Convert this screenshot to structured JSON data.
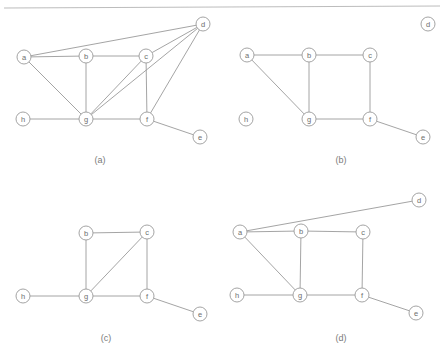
{
  "figure": {
    "width": 444,
    "height": 363,
    "background_color": "#ffffff",
    "line_color": "#9a9a9a",
    "node_fill_color": "#ffffff",
    "label_color": "#6e6e6e",
    "caption_color": "#7a7a7a",
    "node_radius": 7,
    "top_rule": {
      "x1": 4,
      "y1": 8,
      "x2": 440,
      "y2": 6,
      "color": "#b4b4b4"
    }
  },
  "panels": [
    {
      "id": "panel-a",
      "caption": "(a)",
      "caption_pos": {
        "x": 100,
        "y": 160
      },
      "nodes": [
        {
          "id": "a",
          "label": "a",
          "x": 24,
          "y": 57
        },
        {
          "id": "b",
          "label": "b",
          "x": 86,
          "y": 56
        },
        {
          "id": "c",
          "label": "c",
          "x": 146,
          "y": 56
        },
        {
          "id": "d",
          "label": "d",
          "x": 203,
          "y": 24
        },
        {
          "id": "h",
          "label": "h",
          "x": 23,
          "y": 119
        },
        {
          "id": "g",
          "label": "g",
          "x": 86,
          "y": 119
        },
        {
          "id": "f",
          "label": "f",
          "x": 147,
          "y": 119
        },
        {
          "id": "e",
          "label": "e",
          "x": 200,
          "y": 137
        }
      ],
      "edges": [
        {
          "from": "a",
          "to": "b"
        },
        {
          "from": "b",
          "to": "c"
        },
        {
          "from": "a",
          "to": "d"
        },
        {
          "from": "c",
          "to": "d"
        },
        {
          "from": "a",
          "to": "g"
        },
        {
          "from": "b",
          "to": "g"
        },
        {
          "from": "c",
          "to": "g"
        },
        {
          "from": "c",
          "to": "f"
        },
        {
          "from": "d",
          "to": "f"
        },
        {
          "from": "d",
          "to": "g"
        },
        {
          "from": "h",
          "to": "g"
        },
        {
          "from": "g",
          "to": "f"
        },
        {
          "from": "f",
          "to": "e"
        }
      ]
    },
    {
      "id": "panel-b",
      "caption": "(b)",
      "caption_pos": {
        "x": 341,
        "y": 160
      },
      "nodes": [
        {
          "id": "a",
          "label": "a",
          "x": 247,
          "y": 55
        },
        {
          "id": "b",
          "label": "b",
          "x": 309,
          "y": 55
        },
        {
          "id": "c",
          "label": "c",
          "x": 370,
          "y": 55
        },
        {
          "id": "d",
          "label": "d",
          "x": 428,
          "y": 24
        },
        {
          "id": "h",
          "label": "h",
          "x": 246,
          "y": 119
        },
        {
          "id": "g",
          "label": "g",
          "x": 309,
          "y": 119
        },
        {
          "id": "f",
          "label": "f",
          "x": 370,
          "y": 119
        },
        {
          "id": "e",
          "label": "e",
          "x": 423,
          "y": 137
        }
      ],
      "edges": [
        {
          "from": "a",
          "to": "b"
        },
        {
          "from": "b",
          "to": "c"
        },
        {
          "from": "a",
          "to": "g"
        },
        {
          "from": "b",
          "to": "g"
        },
        {
          "from": "c",
          "to": "f"
        },
        {
          "from": "g",
          "to": "f"
        },
        {
          "from": "f",
          "to": "e"
        }
      ]
    },
    {
      "id": "panel-c",
      "caption": "(c)",
      "caption_pos": {
        "x": 106,
        "y": 338
      },
      "nodes": [
        {
          "id": "b",
          "label": "b",
          "x": 86,
          "y": 233
        },
        {
          "id": "c",
          "label": "c",
          "x": 147,
          "y": 232
        },
        {
          "id": "h",
          "label": "h",
          "x": 23,
          "y": 296
        },
        {
          "id": "g",
          "label": "g",
          "x": 86,
          "y": 296
        },
        {
          "id": "f",
          "label": "f",
          "x": 147,
          "y": 296
        },
        {
          "id": "e",
          "label": "e",
          "x": 200,
          "y": 314
        }
      ],
      "edges": [
        {
          "from": "b",
          "to": "c"
        },
        {
          "from": "b",
          "to": "g"
        },
        {
          "from": "c",
          "to": "g"
        },
        {
          "from": "c",
          "to": "f"
        },
        {
          "from": "h",
          "to": "g"
        },
        {
          "from": "g",
          "to": "f"
        },
        {
          "from": "f",
          "to": "e"
        }
      ]
    },
    {
      "id": "panel-d",
      "caption": "(d)",
      "caption_pos": {
        "x": 341,
        "y": 338
      },
      "nodes": [
        {
          "id": "a",
          "label": "a",
          "x": 240,
          "y": 232
        },
        {
          "id": "b",
          "label": "b",
          "x": 301,
          "y": 231
        },
        {
          "id": "c",
          "label": "c",
          "x": 363,
          "y": 232
        },
        {
          "id": "d",
          "label": "d",
          "x": 419,
          "y": 200
        },
        {
          "id": "h",
          "label": "h",
          "x": 237,
          "y": 295
        },
        {
          "id": "g",
          "label": "g",
          "x": 300,
          "y": 295
        },
        {
          "id": "f",
          "label": "f",
          "x": 362,
          "y": 295
        },
        {
          "id": "e",
          "label": "e",
          "x": 416,
          "y": 313
        }
      ],
      "edges": [
        {
          "from": "a",
          "to": "b"
        },
        {
          "from": "b",
          "to": "c"
        },
        {
          "from": "a",
          "to": "d"
        },
        {
          "from": "a",
          "to": "g"
        },
        {
          "from": "b",
          "to": "g"
        },
        {
          "from": "c",
          "to": "f"
        },
        {
          "from": "h",
          "to": "g"
        },
        {
          "from": "g",
          "to": "f"
        },
        {
          "from": "f",
          "to": "e"
        }
      ]
    }
  ]
}
